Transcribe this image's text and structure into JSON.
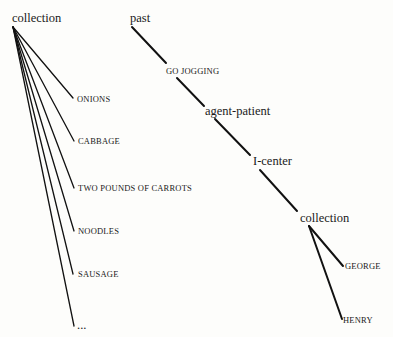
{
  "left_tree": {
    "root": {
      "label": "collection",
      "x": 12,
      "y": 22,
      "apex": [
        13,
        27
      ]
    },
    "children": [
      {
        "label": "ONIONS",
        "x": 77,
        "y": 102,
        "end": [
          73,
          98
        ]
      },
      {
        "label": "CABBAGE",
        "x": 78,
        "y": 144,
        "end": [
          74,
          141
        ]
      },
      {
        "label": "TWO POUNDS OF CARROTS",
        "x": 78,
        "y": 191,
        "end": [
          74,
          188
        ]
      },
      {
        "label": "NOODLES",
        "x": 78,
        "y": 234,
        "end": [
          74,
          231
        ]
      },
      {
        "label": "SAUSAGE",
        "x": 78,
        "y": 277,
        "end": [
          73,
          274
        ]
      },
      {
        "label": "...",
        "x": 77,
        "y": 329,
        "end": [
          74,
          326
        ]
      }
    ]
  },
  "right_tree": {
    "nodes": [
      {
        "label": "past",
        "x": 130,
        "y": 22,
        "style": "node"
      },
      {
        "label": "GO JOGGING",
        "x": 166,
        "y": 74,
        "style": "leaf"
      },
      {
        "label": "agent-patient",
        "x": 205,
        "y": 115,
        "style": "node"
      },
      {
        "label": "I-center",
        "x": 253,
        "y": 165,
        "style": "node"
      },
      {
        "label": "collection",
        "x": 300,
        "y": 222,
        "style": "node"
      },
      {
        "label": "GEORGE",
        "x": 345,
        "y": 269,
        "style": "leaf"
      },
      {
        "label": "HENRY",
        "x": 343,
        "y": 323,
        "style": "leaf"
      }
    ],
    "edges": [
      {
        "from": [
          132,
          27
        ],
        "to": [
          166,
          63
        ]
      },
      {
        "from": [
          177,
          78
        ],
        "to": [
          204,
          106
        ]
      },
      {
        "from": [
          215,
          119
        ],
        "to": [
          250,
          155
        ]
      },
      {
        "from": [
          260,
          170
        ],
        "to": [
          297,
          211
        ]
      },
      {
        "from": [
          309,
          226
        ],
        "to": [
          343,
          266
        ]
      },
      {
        "from": [
          309,
          226
        ],
        "to": [
          342,
          319
        ]
      }
    ]
  }
}
